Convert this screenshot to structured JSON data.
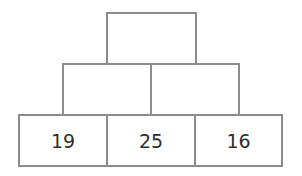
{
  "pyramid": {
    "colors": {
      "line": "#8c8c8c",
      "text": "#2e2e2e",
      "background": "#ffffff"
    },
    "rows": [
      {
        "cells": [
          {
            "value": ""
          }
        ]
      },
      {
        "cells": [
          {
            "value": ""
          },
          {
            "value": ""
          }
        ]
      },
      {
        "cells": [
          {
            "value": "19"
          },
          {
            "value": "25"
          },
          {
            "value": "16"
          }
        ]
      }
    ]
  }
}
